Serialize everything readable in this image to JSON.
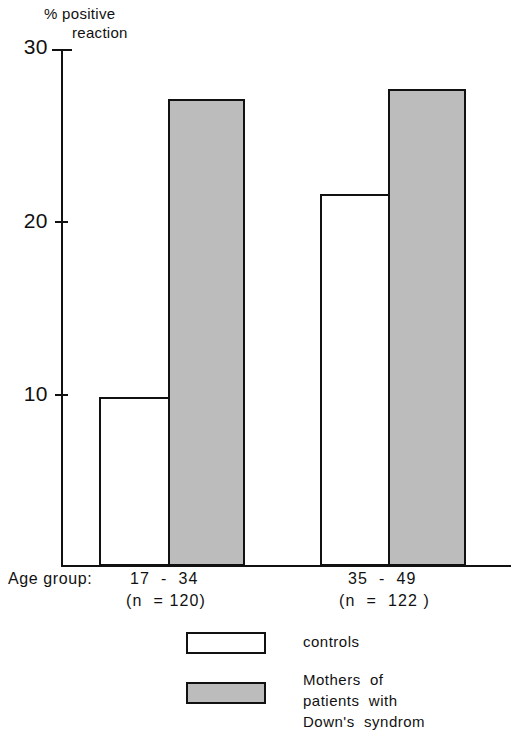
{
  "chart_data": {
    "type": "bar",
    "title": "% positive reaction",
    "title_lines": [
      "% positive",
      "reaction"
    ],
    "xlabel": "Age group:",
    "ylabel": "% positive reaction",
    "ylim": [
      0,
      30
    ],
    "yticks": [
      10,
      20,
      30
    ],
    "ytick_labels": [
      "10",
      "20",
      "30"
    ],
    "grid": false,
    "legend_position": "bottom",
    "categories": [
      "17 - 34",
      "35 - 49"
    ],
    "category_sublabels": [
      "(n = 120)",
      "(n = 122 )"
    ],
    "series": [
      {
        "name": "controls",
        "values": [
          9.8,
          21.6
        ],
        "color": "#ffffff"
      },
      {
        "name": "Mothers of patients with Down's syndrom",
        "values": [
          27.1,
          27.7
        ],
        "color": "#bcbcbc"
      }
    ]
  },
  "axis": {
    "caption": "Age group:",
    "title_line1": "% positive",
    "title_line2": "reaction",
    "ytick_30": "30",
    "ytick_20": "20",
    "ytick_10": "10"
  },
  "categories": [
    {
      "range": "17  -  34",
      "n": "(n  = 120)"
    },
    {
      "range": "35  -  49",
      "n": "(n  =  122 )"
    }
  ],
  "legend": {
    "items": [
      {
        "label": "controls",
        "swatch": "white-box-swatch"
      },
      {
        "label": "Mothers  of\npatients  with\nDown's  syndrom",
        "swatch": "gray-box-swatch"
      }
    ]
  },
  "colors": {
    "ink": "#111111",
    "background": "#ffffff",
    "mothers_fill": "#bcbcbc",
    "controls_fill": "#ffffff"
  }
}
